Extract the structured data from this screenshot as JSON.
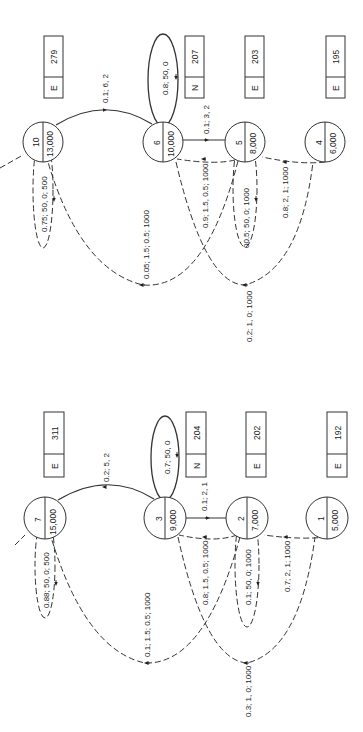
{
  "diagrams": [
    {
      "id": "top",
      "nodes": [
        {
          "id": "10",
          "value": "13,000",
          "cx": 43,
          "cy": 142
        },
        {
          "id": "6",
          "value": "10,000",
          "cx": 163,
          "cy": 142
        },
        {
          "id": "5",
          "value": "8,000",
          "cx": 245,
          "cy": 142
        },
        {
          "id": "4",
          "value": "6,000",
          "cx": 325,
          "cy": 142
        }
      ],
      "boxes": [
        {
          "type": "E",
          "value": "279"
        },
        {
          "type": "N",
          "value": "207"
        },
        {
          "type": "E",
          "value": "203"
        },
        {
          "type": "E",
          "value": "195"
        }
      ],
      "edges": {
        "arc_10_6": "0.1; 6, 2",
        "self_6": "0.8; 50, 0",
        "edge_6_5": "0.1; 3, 2",
        "edge_5_6": "0.9; 1.5, 0.5; 1000",
        "self_5": "00.5; 50, 0; 1000",
        "edge_4_5": "0.8; 2, 1; 1000",
        "self_10": "0.75; 50, 0; 500",
        "long_5_10": "0.05; 1.5; 0.5; 1000",
        "long_6_4": "0.2; 1, 0; 1000"
      }
    },
    {
      "id": "bottom",
      "nodes": [
        {
          "id": "7",
          "value": "15,000"
        },
        {
          "id": "3",
          "value": "9,000"
        },
        {
          "id": "2",
          "value": "7,000"
        },
        {
          "id": "1",
          "value": "5,000"
        }
      ],
      "boxes": [
        {
          "type": "E",
          "value": "311"
        },
        {
          "type": "N",
          "value": "204"
        },
        {
          "type": "E",
          "value": "202"
        },
        {
          "type": "E",
          "value": "192"
        }
      ],
      "edges": {
        "arc_7_3": "0.2; 5, 2",
        "self_3": "0.7; 50, 0",
        "edge_3_2": "0.1; 2, 1",
        "edge_2_3": "0.8; 1.5, 0.5; 1000",
        "self_2": "0.1; 50, 0; 1000",
        "edge_1_2": "0.7; 2, 1; 1000",
        "self_7": "0.88; 50, 0; 500",
        "long_2_7": "0.1; 1.5; 0.5; 1000",
        "long_3_1": "0.3; 1, 0; 1000"
      }
    }
  ]
}
